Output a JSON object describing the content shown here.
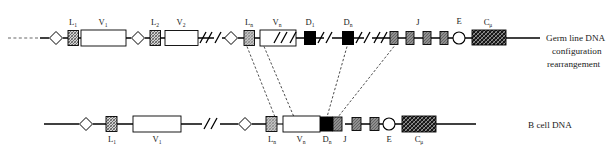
{
  "figure": {
    "kind": "vdj-recombination-diagram",
    "background_color": "#ffffff",
    "ink_color": "#1a1a1a",
    "rows": [
      {
        "id": "germline",
        "side_label_lines": [
          "Germ line DNA",
          "configuration",
          "rearrangement"
        ],
        "segment_labels": [
          "L",
          "V",
          "L",
          "V",
          "L",
          "V",
          "D",
          "D",
          "J",
          "E",
          "C"
        ],
        "segment_subscripts": [
          "1",
          "1",
          "2",
          "2",
          "n",
          "n",
          "1",
          "n",
          "",
          "",
          "μ"
        ],
        "j_box_count": 4,
        "break_marks": 5
      },
      {
        "id": "bcell",
        "side_label_lines": [
          "B cell DNA"
        ],
        "segment_labels": [
          "L",
          "V",
          "L",
          "V",
          "D",
          "J",
          "E",
          "C"
        ],
        "segment_subscripts": [
          "1",
          "1",
          "n",
          "n",
          "n",
          "",
          "",
          "μ"
        ],
        "j_box_count": 2,
        "break_marks": 1
      }
    ],
    "labels": {
      "L1": "L",
      "L1_sub": "1",
      "V1": "V",
      "V1_sub": "1",
      "L2": "L",
      "L2_sub": "2",
      "V2": "V",
      "V2_sub": "2",
      "Ln": "L",
      "Ln_sub": "n",
      "Vn": "V",
      "Vn_sub": "n",
      "D1": "D",
      "D1_sub": "1",
      "Dn": "D",
      "Dn_sub": "n",
      "J": "J",
      "E": "E",
      "Cmu": "C",
      "Cmu_sub": "μ"
    },
    "right_text": {
      "germline_line1": "Germ line DNA",
      "germline_line2": "configuration",
      "germline_line3": "rearrangement",
      "bcell_line1": "B cell DNA"
    },
    "colors": {
      "line": "#000000",
      "leader_box": "#b9b9b9",
      "v_box": "#ffffff",
      "d_box": "#000000",
      "j_box": "#8a8a8a",
      "c_box": "#111111",
      "dashed_connector": "#111111"
    }
  }
}
